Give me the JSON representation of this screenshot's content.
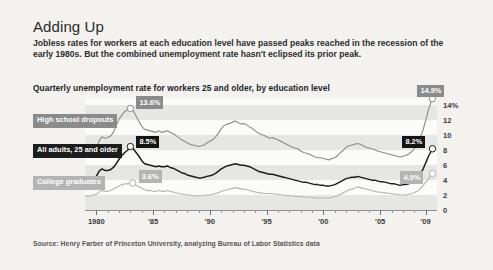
{
  "headline": "Adding Up",
  "deck": "Jobless rates for workers at each education level have passed peaks reached in the recession of the early 1980s. But the combined unemployment rate hasn't eclipsed its prior peak.",
  "subhead": "Quarterly unemployment rate for workers 25 and older, by education level",
  "source": "Source: Henry Farber of Princeton University, analyzing Bureau of Labor Statistics data",
  "legend": [
    {
      "key": "hs",
      "label": "High school dropouts",
      "color": "#8b8b8b"
    },
    {
      "key": "all",
      "label": "All adults, 25 and older",
      "color": "#1d1d1d"
    },
    {
      "key": "college",
      "label": "College graduates",
      "color": "#b4b4b4"
    }
  ],
  "callouts": {
    "hs_peak": {
      "text": "13.6%",
      "year": 1983.0,
      "value": 13.6
    },
    "all_peak": {
      "text": "8.5%",
      "year": 1983.0,
      "value": 8.5
    },
    "college_peak": {
      "text": "3.6%",
      "year": 1983.2,
      "value": 3.6
    },
    "hs_end": {
      "text": "14.9%",
      "year": 2009.6,
      "value": 14.9
    },
    "all_end": {
      "text": "8.2%",
      "year": 2009.6,
      "value": 8.2
    },
    "college_end": {
      "text": "4.9%",
      "year": 2009.6,
      "value": 4.9
    }
  },
  "chart_data": {
    "type": "line",
    "title": "Quarterly unemployment rate for workers 25 and older, by education level",
    "xlabel": "",
    "ylabel": "",
    "xlim": [
      1979.0,
      2010.0
    ],
    "ylim": [
      0,
      15
    ],
    "grid": "horizontal-bands",
    "legend_position": "left-inside",
    "ytick_labels": [
      "14%",
      "12",
      "10",
      "8",
      "6",
      "4",
      "2",
      "0"
    ],
    "yticks": [
      14,
      12,
      10,
      8,
      6,
      4,
      2,
      0
    ],
    "xtick_labels": [
      "1980",
      "'85",
      "'90",
      "'95",
      "'00",
      "'05",
      "'09"
    ],
    "xticks": [
      1980,
      1985,
      1990,
      1995,
      2000,
      2005,
      2009
    ],
    "x": [
      1979.0,
      1979.25,
      1979.5,
      1979.75,
      1980.0,
      1980.25,
      1980.5,
      1980.75,
      1981.0,
      1981.25,
      1981.5,
      1981.75,
      1982.0,
      1982.25,
      1982.5,
      1982.75,
      1983.0,
      1983.25,
      1983.5,
      1983.75,
      1984.0,
      1984.25,
      1984.5,
      1984.75,
      1985.0,
      1985.25,
      1985.5,
      1985.75,
      1986.0,
      1986.25,
      1986.5,
      1986.75,
      1987.0,
      1987.25,
      1987.5,
      1987.75,
      1988.0,
      1988.25,
      1988.5,
      1988.75,
      1989.0,
      1989.25,
      1989.5,
      1989.75,
      1990.0,
      1990.25,
      1990.5,
      1990.75,
      1991.0,
      1991.25,
      1991.5,
      1991.75,
      1992.0,
      1992.25,
      1992.5,
      1992.75,
      1993.0,
      1993.25,
      1993.5,
      1993.75,
      1994.0,
      1994.25,
      1994.5,
      1994.75,
      1995.0,
      1995.25,
      1995.5,
      1995.75,
      1996.0,
      1996.25,
      1996.5,
      1996.75,
      1997.0,
      1997.25,
      1997.5,
      1997.75,
      1998.0,
      1998.25,
      1998.5,
      1998.75,
      1999.0,
      1999.25,
      1999.5,
      1999.75,
      2000.0,
      2000.25,
      2000.5,
      2000.75,
      2001.0,
      2001.25,
      2001.5,
      2001.75,
      2002.0,
      2002.25,
      2002.5,
      2002.75,
      2003.0,
      2003.25,
      2003.5,
      2003.75,
      2004.0,
      2004.25,
      2004.5,
      2004.75,
      2005.0,
      2005.25,
      2005.5,
      2005.75,
      2006.0,
      2006.25,
      2006.5,
      2006.75,
      2007.0,
      2007.25,
      2007.5,
      2007.75,
      2008.0,
      2008.25,
      2008.5,
      2008.75,
      2009.0,
      2009.25,
      2009.5,
      2009.6
    ],
    "series": [
      {
        "name": "High school dropouts",
        "color": "#8b8b8b",
        "values": [
          7.6,
          7.5,
          7.6,
          7.7,
          8.2,
          9.3,
          9.8,
          9.6,
          9.7,
          9.9,
          10.4,
          11.3,
          12.2,
          12.7,
          13.2,
          13.4,
          13.6,
          13.3,
          12.6,
          11.9,
          11.2,
          10.8,
          10.7,
          10.6,
          10.5,
          10.4,
          10.6,
          10.4,
          10.5,
          10.6,
          10.4,
          10.2,
          10.0,
          9.7,
          9.4,
          9.2,
          9.0,
          8.8,
          8.7,
          8.6,
          8.5,
          8.6,
          8.7,
          9.0,
          9.2,
          9.4,
          9.8,
          10.3,
          10.9,
          11.3,
          11.5,
          11.6,
          11.8,
          11.9,
          11.7,
          11.5,
          11.6,
          11.4,
          11.1,
          10.9,
          10.6,
          10.3,
          10.1,
          10.0,
          9.8,
          9.6,
          9.7,
          9.5,
          9.4,
          9.2,
          9.0,
          8.8,
          8.6,
          8.4,
          8.3,
          8.2,
          7.9,
          7.7,
          7.6,
          7.5,
          7.3,
          7.1,
          7.0,
          7.0,
          6.9,
          6.8,
          6.7,
          6.9,
          7.0,
          7.3,
          7.7,
          8.0,
          8.4,
          8.6,
          8.7,
          8.8,
          8.9,
          8.8,
          8.6,
          8.4,
          8.3,
          8.2,
          8.1,
          7.9,
          7.8,
          7.7,
          7.6,
          7.5,
          7.4,
          7.3,
          7.2,
          7.1,
          7.2,
          7.3,
          7.5,
          7.8,
          8.2,
          8.8,
          9.6,
          10.6,
          12.0,
          13.4,
          14.6,
          14.9
        ]
      },
      {
        "name": "All adults, 25 and older",
        "color": "#1d1d1d",
        "values": [
          4.1,
          4.0,
          4.1,
          4.2,
          4.5,
          5.2,
          5.5,
          5.3,
          5.3,
          5.4,
          5.7,
          6.2,
          6.8,
          7.3,
          7.7,
          8.0,
          8.5,
          8.2,
          7.7,
          7.2,
          6.6,
          6.2,
          6.1,
          6.0,
          5.9,
          5.8,
          5.9,
          5.8,
          5.8,
          5.9,
          5.7,
          5.6,
          5.4,
          5.2,
          5.0,
          4.9,
          4.7,
          4.6,
          4.5,
          4.4,
          4.3,
          4.3,
          4.4,
          4.5,
          4.6,
          4.7,
          4.9,
          5.2,
          5.5,
          5.7,
          5.9,
          6.0,
          6.1,
          6.2,
          6.1,
          6.0,
          6.0,
          5.9,
          5.8,
          5.6,
          5.4,
          5.2,
          5.1,
          5.0,
          4.9,
          4.8,
          4.8,
          4.7,
          4.6,
          4.5,
          4.4,
          4.3,
          4.2,
          4.1,
          4.0,
          3.9,
          3.8,
          3.7,
          3.7,
          3.6,
          3.5,
          3.4,
          3.4,
          3.3,
          3.3,
          3.2,
          3.2,
          3.3,
          3.4,
          3.6,
          3.8,
          4.0,
          4.2,
          4.3,
          4.4,
          4.4,
          4.5,
          4.4,
          4.3,
          4.2,
          4.1,
          4.0,
          4.0,
          3.9,
          3.8,
          3.8,
          3.7,
          3.6,
          3.5,
          3.5,
          3.4,
          3.3,
          3.4,
          3.4,
          3.5,
          3.7,
          3.9,
          4.3,
          4.8,
          5.4,
          6.3,
          7.2,
          7.9,
          8.2
        ]
      },
      {
        "name": "College graduates",
        "color": "#b4b4b4",
        "values": [
          1.9,
          1.8,
          1.9,
          2.0,
          2.1,
          2.4,
          2.6,
          2.5,
          2.5,
          2.6,
          2.8,
          3.0,
          3.2,
          3.4,
          3.5,
          3.5,
          3.6,
          3.5,
          3.3,
          3.1,
          2.9,
          2.7,
          2.6,
          2.6,
          2.5,
          2.5,
          2.6,
          2.5,
          2.5,
          2.6,
          2.5,
          2.4,
          2.3,
          2.2,
          2.1,
          2.1,
          2.0,
          2.0,
          1.9,
          1.9,
          1.9,
          1.9,
          1.9,
          2.0,
          2.0,
          2.1,
          2.2,
          2.3,
          2.5,
          2.6,
          2.7,
          2.8,
          2.9,
          3.0,
          2.9,
          2.8,
          2.8,
          2.7,
          2.6,
          2.5,
          2.4,
          2.3,
          2.3,
          2.2,
          2.2,
          2.2,
          2.2,
          2.1,
          2.1,
          2.0,
          2.0,
          1.9,
          1.9,
          1.9,
          1.8,
          1.8,
          1.8,
          1.7,
          1.7,
          1.7,
          1.7,
          1.6,
          1.6,
          1.6,
          1.6,
          1.6,
          1.6,
          1.7,
          1.8,
          1.9,
          2.1,
          2.3,
          2.5,
          2.7,
          2.8,
          2.9,
          3.1,
          3.0,
          2.9,
          2.8,
          2.7,
          2.6,
          2.5,
          2.4,
          2.4,
          2.3,
          2.3,
          2.2,
          2.2,
          2.1,
          2.1,
          2.0,
          2.0,
          2.0,
          2.1,
          2.2,
          2.3,
          2.5,
          2.8,
          3.2,
          3.7,
          4.2,
          4.7,
          4.9
        ]
      }
    ]
  }
}
